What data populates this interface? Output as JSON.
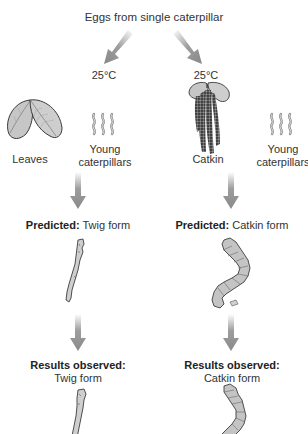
{
  "diagram": {
    "title": "Eggs from single caterpillar",
    "branches": [
      {
        "id": "left",
        "temperature": "25°C",
        "food_source": "Leaves",
        "larvae_label_line1": "Young",
        "larvae_label_line2": "caterpillars",
        "predicted_prefix": "Predicted:",
        "predicted_value": "Twig form",
        "results_prefix": "Results observed:",
        "results_value": "Twig form"
      },
      {
        "id": "right",
        "temperature": "25°C",
        "food_source": "Catkin",
        "larvae_label_line1": "Young",
        "larvae_label_line2": "caterpillars",
        "predicted_prefix": "Predicted:",
        "predicted_value": "Catkin form",
        "results_prefix": "Results observed:",
        "results_value": "Catkin form"
      }
    ],
    "icons": {
      "leaves": "leaves-icon",
      "catkin": "catkin-icon",
      "larvae": "young-caterpillars-icon",
      "twig_caterpillar": "twig-form-caterpillar-icon",
      "catkin_caterpillar": "catkin-form-caterpillar-icon",
      "arrow": "arrow-icon"
    },
    "colors": {
      "arrow": "#8c8c8c",
      "leaf_fill": "#c9c9c9",
      "leaf_stroke": "#3a3a3a",
      "catkin_dark": "#4a4a4a",
      "text": "#333333"
    }
  }
}
